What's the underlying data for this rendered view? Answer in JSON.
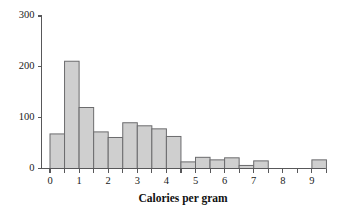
{
  "chart_data": {
    "type": "bar",
    "title": "",
    "subtitle": "",
    "xlabel": "Calories per gram",
    "ylabel": "",
    "xlim": [
      -0.25,
      9.6
    ],
    "ylim": [
      0,
      300
    ],
    "grid": false,
    "legend": null,
    "bin_width": 0.5,
    "x_tick_labels": [
      "0",
      "1",
      "2",
      "3",
      "4",
      "5",
      "6",
      "7",
      "8",
      "9"
    ],
    "x_tick_values": [
      0,
      1,
      2,
      3,
      4,
      5,
      6,
      7,
      8,
      9
    ],
    "x_minor_tick_values": [
      0.5,
      1.5,
      2.5,
      3.5,
      4.5,
      5.5,
      6.5,
      7.5,
      8.5,
      9.5
    ],
    "y_tick_labels": [
      "0",
      "100",
      "200",
      "300"
    ],
    "y_tick_values": [
      0,
      100,
      200,
      300
    ],
    "bin_starts": [
      0.0,
      0.5,
      1.0,
      1.5,
      2.0,
      2.5,
      3.0,
      3.5,
      4.0,
      4.5,
      5.0,
      5.5,
      6.0,
      6.5,
      7.0,
      7.5,
      8.0,
      8.5,
      9.0
    ],
    "categories": [
      "0.0-0.5",
      "0.5-1.0",
      "1.0-1.5",
      "1.5-2.0",
      "2.0-2.5",
      "2.5-3.0",
      "3.0-3.5",
      "3.5-4.0",
      "4.0-4.5",
      "4.5-5.0",
      "5.0-5.5",
      "5.5-6.0",
      "6.0-6.5",
      "6.5-7.0",
      "7.0-7.5",
      "7.5-8.0",
      "8.0-8.5",
      "8.5-9.0",
      "9.0-9.5"
    ],
    "values": [
      68,
      211,
      120,
      72,
      61,
      90,
      84,
      78,
      63,
      13,
      22,
      17,
      21,
      6,
      15,
      0,
      0,
      0,
      17
    ],
    "bar_fill": "#cfcfcf",
    "bar_stroke": "#6b6b6d",
    "axis_color": "#58585a"
  },
  "axes": {
    "x_title": "Calories per gram"
  }
}
